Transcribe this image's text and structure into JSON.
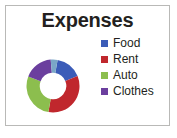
{
  "card": {
    "border_color": "#b9b9b7",
    "background": "#ffffff"
  },
  "chart_data": {
    "type": "pie",
    "variant": "donut",
    "title": "Expenses",
    "xlabel": "",
    "ylabel": "",
    "grid": false,
    "legend_position": "right",
    "categories": [
      "Food",
      "Rent",
      "Auto",
      "Clothes"
    ],
    "values": [
      16,
      34,
      28,
      18
    ],
    "colors": [
      "#3b5cb8",
      "#c0272d",
      "#8cbe4e",
      "#6b3f9e"
    ],
    "slices": [
      {
        "label": "Food",
        "value": 16,
        "color": "#3b5cb8",
        "start_angle": 10,
        "end_angle": 68
      },
      {
        "label": "Rent",
        "value": 34,
        "color": "#c0272d",
        "start_angle": 68,
        "end_angle": 190
      },
      {
        "label": "Auto",
        "value": 28,
        "color": "#8cbe4e",
        "start_angle": 190,
        "end_angle": 291
      },
      {
        "label": "Clothes",
        "value": 18,
        "color": "#6b3f9e",
        "start_angle": 291,
        "end_angle": 355
      },
      {
        "label": "",
        "value": 4,
        "color": "#7aa7c7",
        "start_angle": 355,
        "end_angle": 370
      }
    ],
    "hole_ratio": 0.5
  },
  "legend": {
    "items": [
      {
        "label": "Food",
        "color": "#3b5cb8"
      },
      {
        "label": "Rent",
        "color": "#c0272d"
      },
      {
        "label": "Auto",
        "color": "#8cbe4e"
      },
      {
        "label": "Clothes",
        "color": "#6b3f9e"
      }
    ]
  }
}
